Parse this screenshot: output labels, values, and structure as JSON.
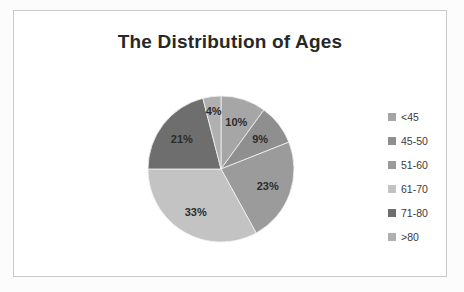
{
  "chart_data": {
    "type": "pie",
    "title": "The Distribution of Ages",
    "categories": [
      "<45",
      "45-50",
      "51-60",
      "61-70",
      "71-80",
      ">80"
    ],
    "values": [
      10,
      9,
      23,
      33,
      21,
      4
    ],
    "data_labels": [
      "10%",
      "9%",
      "23%",
      "33%",
      "21%",
      "4%"
    ],
    "unit": "%",
    "start_angle_deg": 0,
    "direction": "clockwise",
    "legend_position": "right",
    "grid": false,
    "colors": [
      "#a6a6a6",
      "#8f8f8f",
      "#9b9b9b",
      "#c3c3c3",
      "#6e6e6e",
      "#b0b0b0"
    ],
    "label_color": "#2b2b2b",
    "title_color": "#282828",
    "frame_color": "#c9c9c9",
    "background": "#ffffff"
  },
  "chart": {
    "title": "The Distribution of Ages",
    "slices": [
      {
        "label": "<45",
        "value": 10,
        "display": "10%",
        "color": "#a6a6a6"
      },
      {
        "label": "45-50",
        "value": 9,
        "display": "9%",
        "color": "#8f8f8f"
      },
      {
        "label": "51-60",
        "value": 23,
        "display": "23%",
        "color": "#9b9b9b"
      },
      {
        "label": "61-70",
        "value": 33,
        "display": "33%",
        "color": "#c3c3c3"
      },
      {
        "label": "71-80",
        "value": 21,
        "display": "21%",
        "color": "#6e6e6e"
      },
      {
        "label": ">80",
        "value": 4,
        "display": "4%",
        "color": "#b0b0b0"
      }
    ]
  },
  "legend": {
    "items": [
      {
        "label": "<45",
        "color": "#a6a6a6"
      },
      {
        "label": "45-50",
        "color": "#8f8f8f"
      },
      {
        "label": "51-60",
        "color": "#9b9b9b"
      },
      {
        "label": "61-70",
        "color": "#c3c3c3"
      },
      {
        "label": "71-80",
        "color": "#6e6e6e"
      },
      {
        "label": ">80",
        "color": "#b0b0b0"
      }
    ]
  }
}
